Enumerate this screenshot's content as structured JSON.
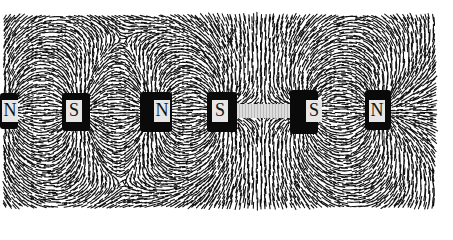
{
  "image": {
    "subject": "Iron filings showing magnetic field lines around a row of bar magnets",
    "colors": {
      "background": "#ffffff",
      "filings": "#111111",
      "magnet": "#0a0a0a",
      "label_plate": "#e6e6e6"
    }
  },
  "magnets": [
    {
      "label": "N",
      "x": 0,
      "plate_x": 2
    },
    {
      "label": "S",
      "x": 62,
      "plate_x": 66
    },
    {
      "label": "N",
      "x": 140,
      "plate_x": 154
    },
    {
      "label": "S",
      "x": 207,
      "plate_x": 212
    },
    {
      "label": "S",
      "x": 290,
      "plate_x": 306
    },
    {
      "label": "N",
      "x": 365,
      "plate_x": 369
    }
  ]
}
